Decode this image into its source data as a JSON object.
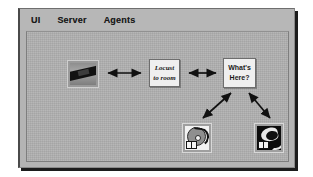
{
  "window": {
    "menubar": {
      "items": [
        {
          "label": "UI",
          "name": "menu-ui"
        },
        {
          "label": "Server",
          "name": "menu-server"
        },
        {
          "label": "Agents",
          "name": "menu-agents"
        }
      ]
    }
  },
  "diagram": {
    "nodes": [
      {
        "id": "scene-photo",
        "kind": "image-thumbnail",
        "label": "",
        "icon": "photo-thumbnail-icon"
      },
      {
        "id": "locate-room",
        "kind": "text-box",
        "line1": "Locust",
        "line2": "to room"
      },
      {
        "id": "whats-here",
        "kind": "text-box",
        "line1": "What's",
        "line2": "Here?"
      },
      {
        "id": "agent-light",
        "kind": "icon-thumbnail",
        "icon": "disc-agent-icon"
      },
      {
        "id": "agent-dark",
        "kind": "icon-thumbnail",
        "icon": "curve-agent-icon"
      }
    ],
    "edges": [
      {
        "from": "scene-photo",
        "to": "locate-room",
        "style": "double-arrow"
      },
      {
        "from": "locate-room",
        "to": "whats-here",
        "style": "double-arrow"
      },
      {
        "from": "whats-here",
        "to": "agent-light",
        "style": "double-arrow-diagonal"
      },
      {
        "from": "whats-here",
        "to": "agent-dark",
        "style": "double-arrow-diagonal"
      }
    ],
    "watermark": ""
  },
  "colors": {
    "window_face": "#b4b4b4",
    "menubar": "#b7b7b7",
    "canvas": "#b0b0b0",
    "node_box": "#efefef",
    "ink": "#1a1a1a",
    "shadow": "#1c1c1c"
  }
}
